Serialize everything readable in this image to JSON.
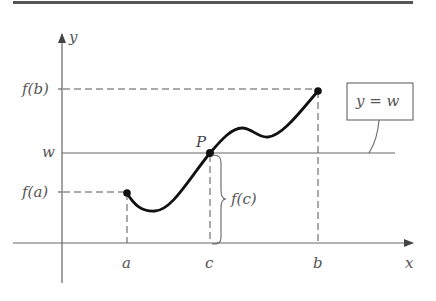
{
  "figure": {
    "axes": {
      "x_label": "x",
      "y_label": "y"
    },
    "x_ticks": [
      {
        "label": "a"
      },
      {
        "label": "c"
      },
      {
        "label": "b"
      }
    ],
    "y_ticks": [
      {
        "label": "f(b)"
      },
      {
        "label": "w"
      },
      {
        "label": "f(a)"
      }
    ],
    "points": [
      {
        "name": "P",
        "label": "P"
      }
    ],
    "brace_label": "f(c)",
    "line_label": "y = w",
    "colors": {
      "curve": "#111111",
      "axis": "#666666",
      "text": "#555555"
    }
  }
}
